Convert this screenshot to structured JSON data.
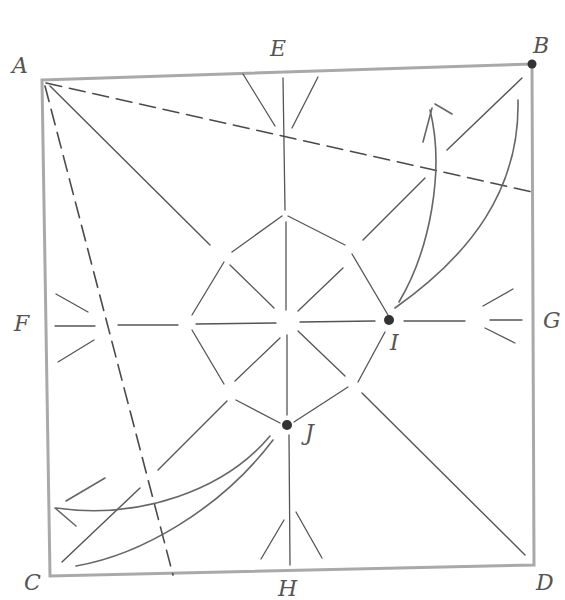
{
  "diagram": {
    "type": "origami crease pattern (hand-drawn pencil)",
    "colors": {
      "paper": "#ffffff",
      "square_border": "#a8a8a8",
      "crease": "#555555",
      "dashed_crease": "#4a4a4a",
      "arrow": "#666666",
      "point": "#333333",
      "label": "#555555"
    },
    "labels": {
      "A": "A",
      "B": "B",
      "C": "C",
      "D": "D",
      "E": "E",
      "F": "F",
      "G": "G",
      "H": "H",
      "I": "I",
      "J": "J"
    },
    "points": [
      {
        "id": "A",
        "x": 42,
        "y": 80,
        "marked": false
      },
      {
        "id": "B",
        "x": 532,
        "y": 64,
        "marked": true
      },
      {
        "id": "C",
        "x": 50,
        "y": 575,
        "marked": false
      },
      {
        "id": "D",
        "x": 532,
        "y": 565,
        "marked": false
      },
      {
        "id": "E",
        "x": 283,
        "y": 72,
        "marked": false
      },
      {
        "id": "F",
        "x": 46,
        "y": 326,
        "marked": false
      },
      {
        "id": "G",
        "x": 532,
        "y": 322,
        "marked": false
      },
      {
        "id": "H",
        "x": 290,
        "y": 570,
        "marked": false
      },
      {
        "id": "I",
        "x": 389,
        "y": 320,
        "marked": true
      },
      {
        "id": "J",
        "x": 287,
        "y": 425,
        "marked": true
      }
    ],
    "dashed_creases": [
      {
        "from": "A",
        "to": "right-edge",
        "note": "valley fold from A to right edge below B"
      },
      {
        "from": "A",
        "to": "bottom-edge",
        "note": "valley fold from A to bottom edge right of C"
      }
    ],
    "arrows": [
      {
        "from": "I",
        "to": "B",
        "note": "fold point I up to B"
      },
      {
        "from": "J",
        "to": "C",
        "note": "fold point J down to C"
      }
    ],
    "center_figure": "octagon with radiating creases"
  }
}
